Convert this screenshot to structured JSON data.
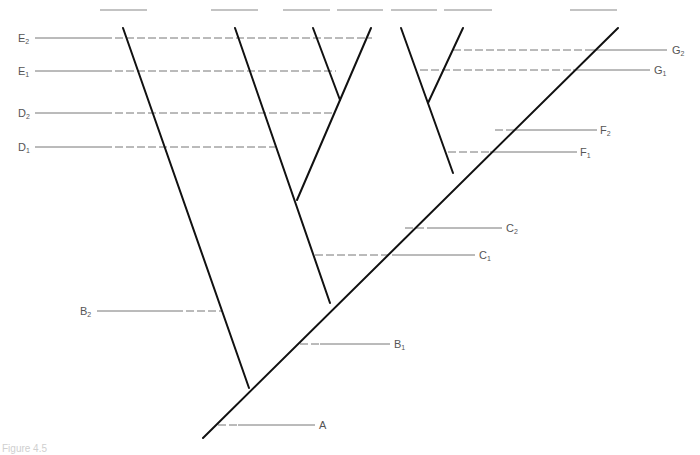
{
  "figure": {
    "caption": "Figure 4.5",
    "colors": {
      "branch": "#111111",
      "guide": "#777777",
      "label": "#555555"
    }
  },
  "labels": {
    "E2": {
      "base": "E",
      "sub": "2"
    },
    "E1": {
      "base": "E",
      "sub": "1"
    },
    "D2": {
      "base": "D",
      "sub": "2"
    },
    "D1": {
      "base": "D",
      "sub": "1"
    },
    "B2": {
      "base": "B",
      "sub": "2"
    },
    "G2": {
      "base": "G",
      "sub": "2"
    },
    "G1": {
      "base": "G",
      "sub": "1"
    },
    "F2": {
      "base": "F",
      "sub": "2"
    },
    "F1": {
      "base": "F",
      "sub": "1"
    },
    "C2": {
      "base": "C",
      "sub": "2"
    },
    "C1": {
      "base": "C",
      "sub": "1"
    },
    "B1": {
      "base": "B",
      "sub": "1"
    },
    "A": {
      "base": "A",
      "sub": ""
    }
  },
  "tips": [
    "tip-1",
    "tip-2",
    "tip-3",
    "tip-4",
    "tip-5",
    "tip-6",
    "tip-7"
  ]
}
